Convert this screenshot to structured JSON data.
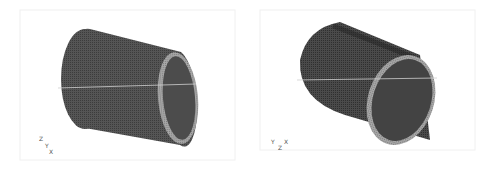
{
  "figure": {
    "panels": [
      {
        "id": "left",
        "description": "Cylindrical shell mesh, view 1",
        "triad": {
          "labels": [
            "Z",
            "Y",
            "X"
          ]
        }
      },
      {
        "id": "right",
        "description": "Cylindrical shell mesh, view 2 (deformed)",
        "triad": {
          "labels": [
            "Y",
            "X",
            "Z"
          ]
        }
      }
    ],
    "colors": {
      "mesh": "#4a4a4a",
      "mesh_dark": "#2e2e2e",
      "rim": "#9a9a9a",
      "background": "#ffffff",
      "frame": "#eeeeee"
    }
  }
}
